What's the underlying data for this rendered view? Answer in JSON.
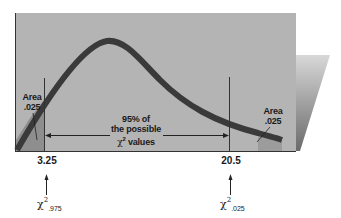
{
  "diagram": {
    "type": "chi-square distribution",
    "colors": {
      "panel": "#b4b4b4",
      "panel_shadow_start": "#c8c8c8",
      "panel_shadow_end": "#6e6e6e",
      "curve": "#3a3a3a",
      "tail_shade": "#8e8e8e",
      "text": "#1a1a1a"
    },
    "left_tail": {
      "label_line1": "Area",
      "label_line2": ".025"
    },
    "right_tail": {
      "label_line1": "Area",
      "label_line2": ".025"
    },
    "center": {
      "line1": "95% of",
      "line2": "the possible",
      "line3_symbol": "χ",
      "line3_sup": "2",
      "line3_rest": " values"
    },
    "critical_values": [
      {
        "value": "3.25",
        "symbol": "χ",
        "sup": "2",
        "sub": ".975"
      },
      {
        "value": "20.5",
        "symbol": "χ",
        "sup": "2",
        "sub": ".025"
      }
    ]
  }
}
